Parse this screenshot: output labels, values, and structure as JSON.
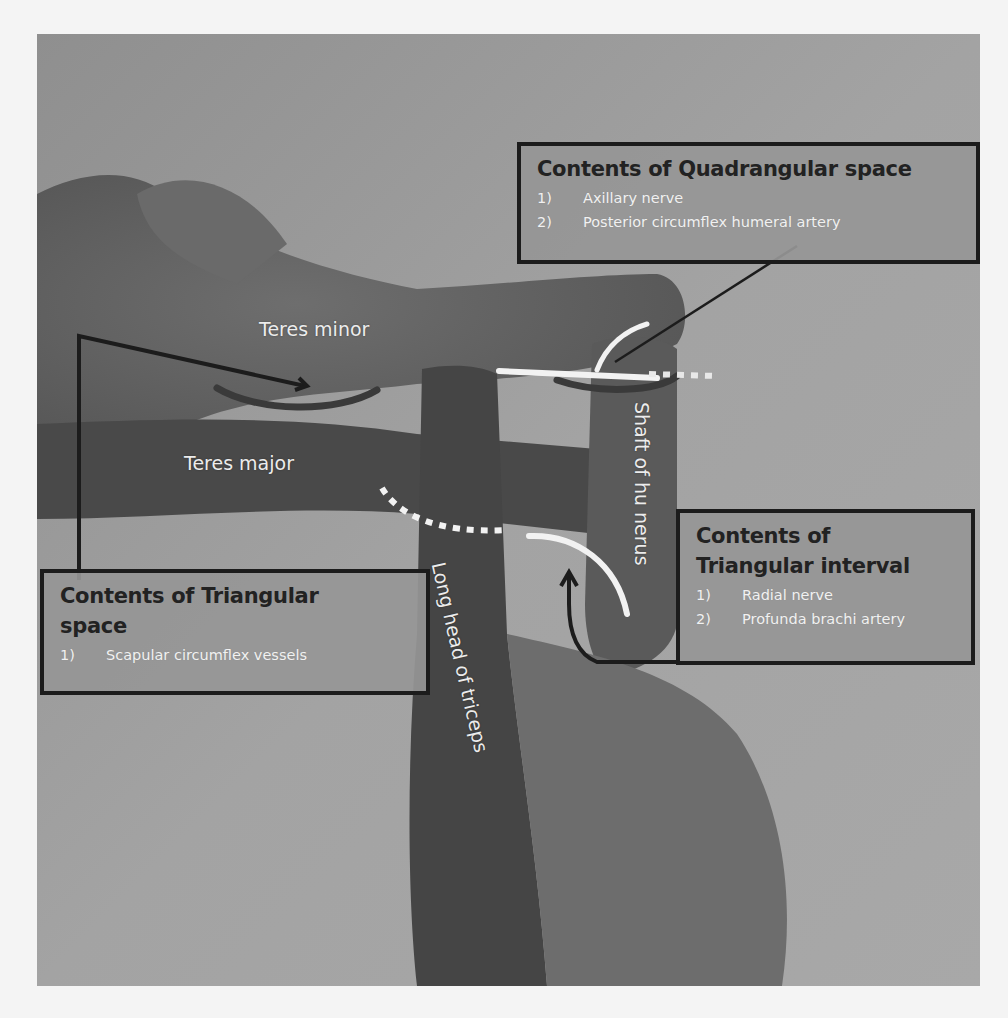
{
  "figure": {
    "colors": {
      "page_background": "#f4f4f4",
      "photo_background": "#9c9c9c",
      "skin_dark": "#4a4a4a",
      "box_border": "#1c1c1c",
      "box_fill": "#969696",
      "title_text": "#222222",
      "list_text": "#f1f1f1",
      "white_marker": "#f2f2f2",
      "dark_arc": "#3a3a3a"
    }
  },
  "boxes": {
    "quadrangular": {
      "title": "Contents of Quadrangular space",
      "items": [
        {
          "num": "1)",
          "text": "Axillary nerve"
        },
        {
          "num": "2)",
          "text": "Posterior circumflex humeral artery"
        }
      ]
    },
    "triangular_space": {
      "title_line1": "Contents of Triangular",
      "title_line2": "space",
      "items": [
        {
          "num": "1)",
          "text": "Scapular circumflex vessels"
        }
      ]
    },
    "triangular_interval": {
      "title_line1": "Contents of",
      "title_line2": "Triangular interval",
      "items": [
        {
          "num": "1)",
          "text": "Radial nerve"
        },
        {
          "num": "2)",
          "text": "Profunda brachi artery"
        }
      ]
    }
  },
  "labels": {
    "teres_minor": "Teres minor",
    "teres_major": "Teres major",
    "long_head_triceps": "Long head of triceps",
    "shaft_humerus": "Shaft of hu nerus"
  }
}
